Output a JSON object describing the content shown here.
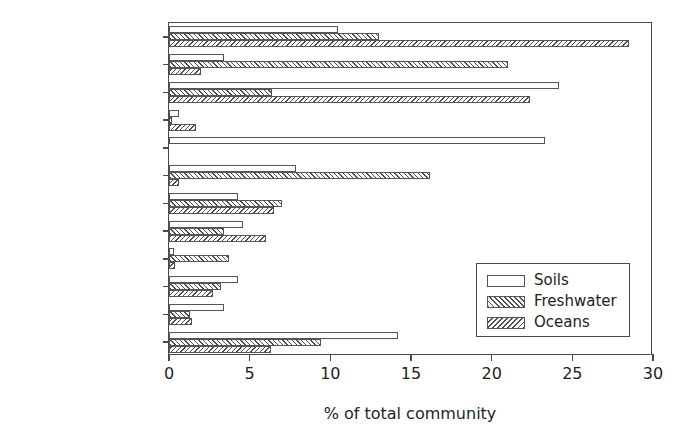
{
  "chart_data": {
    "type": "bar",
    "orientation": "horizontal",
    "title": "",
    "xlabel": "% of total community",
    "ylabel": "",
    "xlim": [
      0,
      30
    ],
    "xticks": [
      0,
      5,
      10,
      15,
      20,
      25,
      30
    ],
    "grid": false,
    "legend_position": "lower-right",
    "categories": [
      "Alpha",
      "Beta",
      "Gamma",
      "Delta",
      "Acidobacteria",
      "Actinobacteria",
      "Bacteroidetes",
      "Cyanobacteria",
      "Firmicutes",
      "Verrucomicrobia",
      "Planctomycetes",
      "Other"
    ],
    "series": [
      {
        "name": "Soils",
        "fill": "white",
        "values": [
          10.5,
          3.4,
          24.2,
          0.6,
          23.3,
          7.9,
          4.3,
          4.6,
          0.3,
          4.3,
          3.4,
          14.2
        ]
      },
      {
        "name": "Freshwater",
        "fill": "forward-hatch",
        "values": [
          13.0,
          21.0,
          6.4,
          0.2,
          0.0,
          16.2,
          7.0,
          3.4,
          3.7,
          3.2,
          1.3,
          9.4
        ]
      },
      {
        "name": "Oceans",
        "fill": "backward-hatch",
        "values": [
          28.5,
          2.0,
          22.4,
          1.7,
          0.0,
          0.6,
          6.5,
          6.0,
          0.4,
          2.7,
          1.4,
          6.3
        ]
      }
    ]
  },
  "legend": {
    "items": [
      {
        "label": "Soils",
        "swatch": "soils"
      },
      {
        "label": "Freshwater",
        "swatch": "freshwater"
      },
      {
        "label": "Oceans",
        "swatch": "oceans"
      }
    ]
  },
  "colors": {
    "axis": "#4a4a4a",
    "text": "#231f20",
    "hatch": "#4f4f4f",
    "background": "#ffffff"
  }
}
